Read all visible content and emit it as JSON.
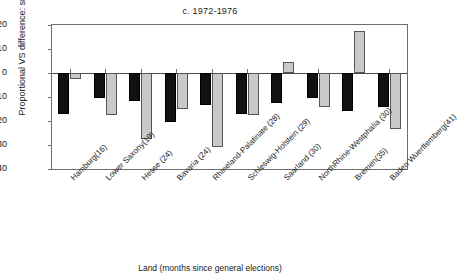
{
  "chart_data": {
    "type": "bar",
    "title": "c. 1972-1976",
    "xlabel": "Land (months since general elections)",
    "ylabel": "Proportional VS difference: sr./jr.",
    "ylim": [
      -40,
      20
    ],
    "ytick_step": 10,
    "yticks": [
      "20",
      "10",
      "0",
      "−10",
      "−20",
      "−30",
      "−40"
    ],
    "grid": false,
    "legend": "none",
    "categories": [
      "Hamburg(16)",
      "Lower Saxony(19)",
      "Hesse (24)",
      "Bavaria (24)",
      "Rhineland-Palatinate (28)",
      "Schleswig-Holstein (29)",
      "Saarland (30)",
      "NorthRhine-Westphalia (30)",
      "Bremen(35)",
      "Baden Wuerttemberg(41)"
    ],
    "series": [
      {
        "name": "senior",
        "color": "#111111",
        "values": [
          -17.0,
          -10.5,
          -11.5,
          -20.5,
          -13.5,
          -17.0,
          -12.5,
          -10.5,
          -16.0,
          -14.0
        ]
      },
      {
        "name": "junior",
        "color": "#c9c9c9",
        "values": [
          -2.5,
          -17.5,
          -27.5,
          -15.0,
          -31.0,
          -17.5,
          4.5,
          -14.0,
          17.5,
          -23.5
        ]
      }
    ]
  }
}
